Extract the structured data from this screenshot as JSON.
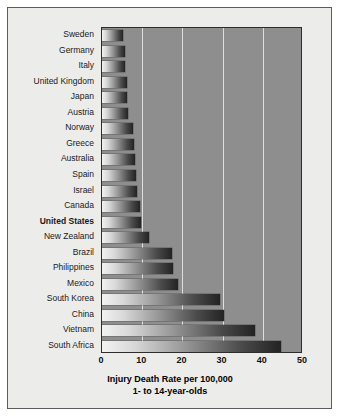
{
  "chart_data": {
    "type": "bar",
    "orientation": "horizontal",
    "title": "Injury Death Rate per 100,000",
    "subtitle": "1- to 14-year-olds",
    "xlabel": "Injury Death Rate per 100,000",
    "ylabel": "",
    "xlim": [
      0,
      50
    ],
    "xticks": [
      0,
      10,
      20,
      30,
      40,
      50
    ],
    "grid": true,
    "legend": "none",
    "highlight_category": "United States",
    "categories": [
      "Sweden",
      "Germany",
      "Italy",
      "United Kingdom",
      "Japan",
      "Austria",
      "Norway",
      "Greece",
      "Australia",
      "Spain",
      "Israel",
      "Canada",
      "United States",
      "New Zealand",
      "Brazil",
      "Philippines",
      "Mexico",
      "South Korea",
      "China",
      "Vietnam",
      "South Africa"
    ],
    "values": [
      5.2,
      5.6,
      5.8,
      6.1,
      6.3,
      6.5,
      7.8,
      8.0,
      8.2,
      8.4,
      8.7,
      9.4,
      9.8,
      11.6,
      17.4,
      17.7,
      19.0,
      29.4,
      30.4,
      38.0,
      44.5
    ]
  },
  "colors": {
    "page_background": "#ffffff",
    "card_background": "#ececeb",
    "card_border": "#5c5c5c",
    "plot_background": "#8e8e8e",
    "plot_border": "#2d2d2d",
    "gridline": "#dedede",
    "bar_gradient_start": "#f2f2f2",
    "bar_gradient_end": "#232323",
    "label_text": "#1a1a1a",
    "title_text": "#000000"
  }
}
